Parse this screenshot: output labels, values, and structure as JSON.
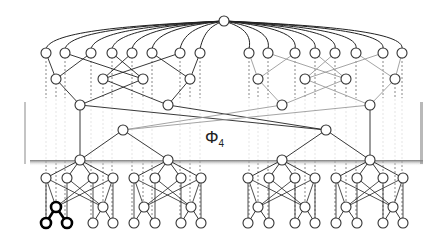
{
  "diagram": {
    "panel_label": "Φ",
    "panel_label_subscript": "4",
    "colors": {
      "edge": "#222222",
      "edge_grey": "#9a9a9a",
      "dashed": "#555555",
      "node_fill": "#ffffff",
      "node_stroke": "#333333",
      "highlight": "#000000",
      "panel_fill": "#ffffff",
      "panel_shadow": "#8a8a8a"
    },
    "panel": {
      "x": 27,
      "y": 98,
      "w": 393,
      "h": 62
    },
    "root": {
      "x": 224,
      "y": 21
    },
    "row1_y": 53,
    "row1_x": [
      46,
      65,
      91,
      112,
      132,
      152,
      180,
      200,
      249,
      268,
      295,
      315,
      335,
      356,
      383,
      402
    ],
    "row2_y": 79,
    "row2_x": [
      56,
      103,
      143,
      190,
      258,
      305,
      346,
      395
    ],
    "row3_y": 105,
    "row3_x": [
      80,
      168,
      282,
      370
    ],
    "row4_y": 130,
    "row4_x": [
      123,
      326
    ],
    "row5_y": 160,
    "row5_x": [
      80,
      168,
      282,
      370
    ],
    "row6_y": 178,
    "row6_offsets": [
      -34,
      -13,
      13,
      33
    ],
    "row7_y": 207,
    "row7_offsets": [
      -24,
      23
    ],
    "row8_y": 223,
    "row8_offsets": [
      -34,
      -13,
      13,
      33
    ],
    "highlight": {
      "parent": [
        56,
        207
      ],
      "children": [
        [
          46,
          223
        ],
        [
          67,
          223
        ]
      ]
    }
  }
}
